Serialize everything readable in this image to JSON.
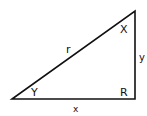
{
  "diagram": {
    "type": "right-triangle",
    "stroke_color": "#111111",
    "background": "#ffffff",
    "vertices": {
      "left": [
        12,
        99
      ],
      "right_angle": [
        135,
        99
      ],
      "top": [
        135,
        11
      ]
    },
    "labels": {
      "hypotenuse": "r",
      "vertical_leg": "y",
      "horizontal_leg": "x",
      "top_angle": "X",
      "left_angle": "Y",
      "right_angle": "R"
    }
  }
}
